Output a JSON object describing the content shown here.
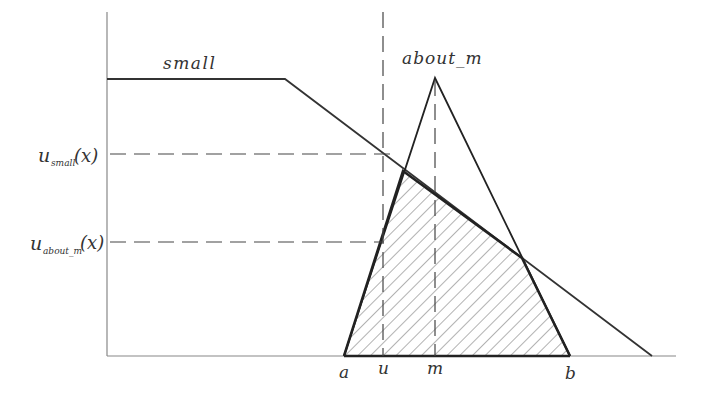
{
  "diagram": {
    "colors": {
      "line": "#333333",
      "axis": "#888888",
      "hatch": "#666666",
      "background": "#ffffff"
    },
    "sets": {
      "small": {
        "label": "small"
      },
      "about_m": {
        "label": "about_m"
      }
    },
    "y_labels": {
      "u_small": {
        "base": "u",
        "sub": "small",
        "arg": "(x)"
      },
      "u_about_m": {
        "base": "u",
        "sub": "about_m",
        "arg": "(x)"
      }
    },
    "x_labels": {
      "a": "a",
      "u": "u",
      "m": "m",
      "b": "b"
    }
  }
}
